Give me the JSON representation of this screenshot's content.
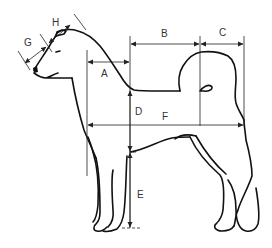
{
  "diagram": {
    "line_color": "#111111",
    "background": "#ffffff",
    "labels": {
      "A": "A",
      "B": "B",
      "C": "C",
      "D": "D",
      "E": "E",
      "F": "F",
      "G": "G",
      "H": "H"
    }
  }
}
